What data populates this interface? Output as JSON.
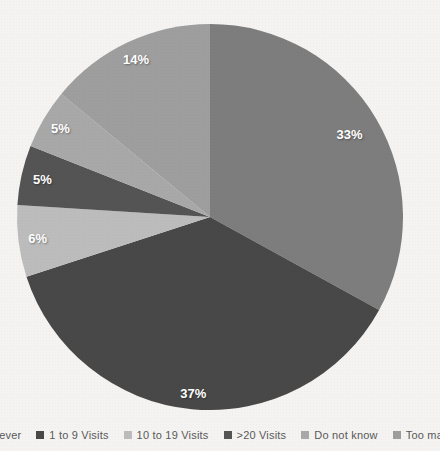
{
  "chart_data": {
    "type": "pie",
    "title": "",
    "direction": "clockwise",
    "start_angle_deg": 0,
    "legend_position": "bottom",
    "data_label_color": "#ffffff",
    "background_color": "#f4f3f1",
    "legend_text_color": "#595959",
    "segments": [
      {
        "label": "Never",
        "value": 33,
        "display": "33%",
        "color": "#7d7d7d",
        "label_r": 0.84
      },
      {
        "label": "1 to 9 Visits",
        "value": 37,
        "display": "37%",
        "color": "#484848",
        "label_r": 0.92
      },
      {
        "label": "10 to 19 Visits",
        "value": 6,
        "display": "6%",
        "color": "#bcbcbc",
        "label_r": 0.9
      },
      {
        "label": ">20 Visits",
        "value": 5,
        "display": "5%",
        "color": "#545454",
        "label_r": 0.89
      },
      {
        "label": "Do not know",
        "value": 5,
        "display": "5%",
        "color": "#a8a8a8",
        "label_r": 0.9
      },
      {
        "label": "Too many",
        "value": 14,
        "display": "14%",
        "color": "#9e9e9e",
        "label_r": 0.9
      }
    ]
  }
}
